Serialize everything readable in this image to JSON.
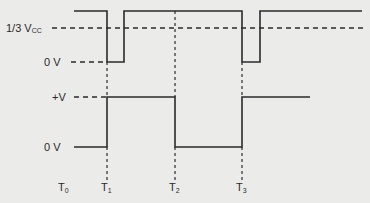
{
  "diagram": {
    "type": "timing-diagram",
    "labels": {
      "vcc_third": "1/3 V",
      "vcc_third_sub": "CC",
      "zero_v_top": "0 V",
      "plus_v": "+V",
      "zero_v_bottom": "0 V"
    },
    "time_markers": [
      {
        "label": "T",
        "sub": "0"
      },
      {
        "label": "T",
        "sub": "1"
      },
      {
        "label": "T",
        "sub": "2"
      },
      {
        "label": "T",
        "sub": "3"
      }
    ],
    "signals": [
      {
        "name": "trigger-input",
        "description": "High, low pulse at T1 and T3 below 1/3 Vcc threshold"
      },
      {
        "name": "output",
        "description": "0 V until T1, +V from T1 to T2, 0 V from T2 to T3, +V after T3"
      }
    ],
    "colors": {
      "line": "#2b2b2b",
      "background": "#ebebea"
    }
  }
}
